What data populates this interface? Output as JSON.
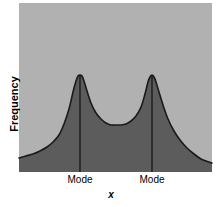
{
  "chart_data": {
    "type": "area",
    "title": "",
    "subtitle": "",
    "xlabel": "x",
    "ylabel": "Frequency",
    "grid": false,
    "legend": null,
    "axis_ticks": {
      "x": [
        "Mode",
        "Mode"
      ],
      "y": []
    },
    "annotations": [
      {
        "label": "Mode",
        "x": 80,
        "type": "vertical-line"
      },
      {
        "label": "Mode",
        "x": 152,
        "type": "vertical-line"
      }
    ],
    "xlim": [
      19,
      212
    ],
    "ylim": [
      172,
      75
    ],
    "series": [
      {
        "name": "frequency",
        "x": [
          19,
          26,
          33,
          40,
          47,
          53,
          59,
          64,
          69,
          73,
          76,
          78,
          80,
          82,
          84,
          87,
          91,
          96,
          101,
          106,
          111,
          116,
          121,
          126,
          131,
          136,
          141,
          145,
          148,
          150,
          152,
          154,
          156,
          159,
          163,
          168,
          174,
          180,
          187,
          194,
          201,
          206,
          212
        ],
        "y": [
          158,
          156,
          154,
          151,
          147,
          142,
          135,
          124,
          109,
          92,
          81,
          76,
          75,
          76,
          81,
          91,
          103,
          113,
          119,
          123,
          125,
          125,
          125,
          124,
          121,
          116,
          107,
          94,
          82,
          77,
          75,
          77,
          82,
          92,
          105,
          119,
          131,
          140,
          148,
          154,
          159,
          161,
          163
        ]
      }
    ]
  },
  "figure": {
    "plot_area": {
      "left": 19,
      "top": 3,
      "right": 212,
      "bottom": 172
    },
    "colors": {
      "page_background": "#ffffff",
      "plot_background": "#b1b1b1",
      "curve_fill": "#5c5c5c",
      "curve_stroke": "#1a1a1a",
      "mode_line": "#1a1a1a",
      "text": "#000000"
    },
    "axis": {
      "y_label": "Frequency",
      "x_label": "x"
    },
    "mode_labels": [
      "Mode",
      "Mode"
    ]
  }
}
